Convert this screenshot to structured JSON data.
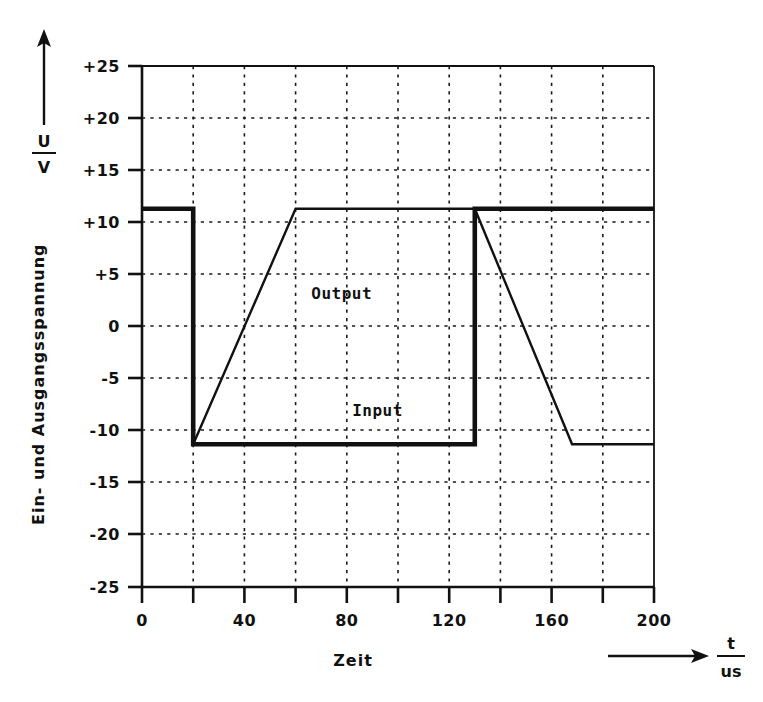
{
  "chart_data": {
    "type": "line",
    "title": "",
    "subtitle": "",
    "xlabel": "Zeit",
    "x_unit_numerator": "t",
    "x_unit_denominator": "us",
    "ylabel": "Ein- und Ausgangsspannung",
    "y_unit_numerator": "U",
    "y_unit_denominator": "V",
    "xlim": [
      0,
      200
    ],
    "ylim": [
      -25,
      25
    ],
    "xticks": [
      0,
      20,
      40,
      60,
      80,
      100,
      120,
      140,
      160,
      180,
      200
    ],
    "xtick_labels": [
      "0",
      "",
      "40",
      "",
      "80",
      "",
      "120",
      "",
      "160",
      "",
      "200"
    ],
    "yticks": [
      25,
      20,
      15,
      10,
      5,
      0,
      -5,
      -10,
      -15,
      -20,
      -25
    ],
    "ytick_labels": [
      "+25",
      "+20",
      "+15",
      "+10",
      "+5",
      "0",
      "-5",
      "-10",
      "-15",
      "-20",
      "-25"
    ],
    "grid": true,
    "grid_style": "dotted",
    "legend_position": "inline-annotation",
    "high_level": 11.3,
    "low_level": -11.3,
    "series": [
      {
        "name": "Input",
        "style": "thick",
        "annotation": "Input",
        "annotation_at": [
          92,
          -8.6
        ],
        "points": [
          [
            0,
            11.3
          ],
          [
            20,
            11.3
          ],
          [
            20,
            -11.3
          ],
          [
            130,
            -11.3
          ],
          [
            130,
            11.3
          ],
          [
            200,
            11.3
          ]
        ]
      },
      {
        "name": "Output",
        "style": "thin",
        "annotation": "Output",
        "annotation_at": [
          78,
          2.6
        ],
        "points": [
          [
            20,
            -11.3
          ],
          [
            60,
            11.3
          ],
          [
            130,
            11.3
          ],
          [
            168,
            -11.3
          ],
          [
            200,
            -11.3
          ]
        ]
      }
    ]
  },
  "axes": {
    "y_arrow": "up-arrow",
    "x_arrow": "right-arrow"
  }
}
